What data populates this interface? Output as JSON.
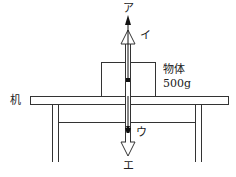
{
  "diagram": {
    "type": "force diagram",
    "object": {
      "label": "物体",
      "mass": "500g"
    },
    "table_label": "机",
    "arrows": [
      {
        "id": "a",
        "label": "ア",
        "direction": "up",
        "style": "solid"
      },
      {
        "id": "i",
        "label": "イ",
        "direction": "up",
        "style": "hollow"
      },
      {
        "id": "u",
        "label": "ウ",
        "direction": "down",
        "style": "solid"
      },
      {
        "id": "e",
        "label": "エ",
        "direction": "down",
        "style": "hollow"
      }
    ],
    "colors": {
      "line": "#333333",
      "background": "#ffffff"
    }
  }
}
